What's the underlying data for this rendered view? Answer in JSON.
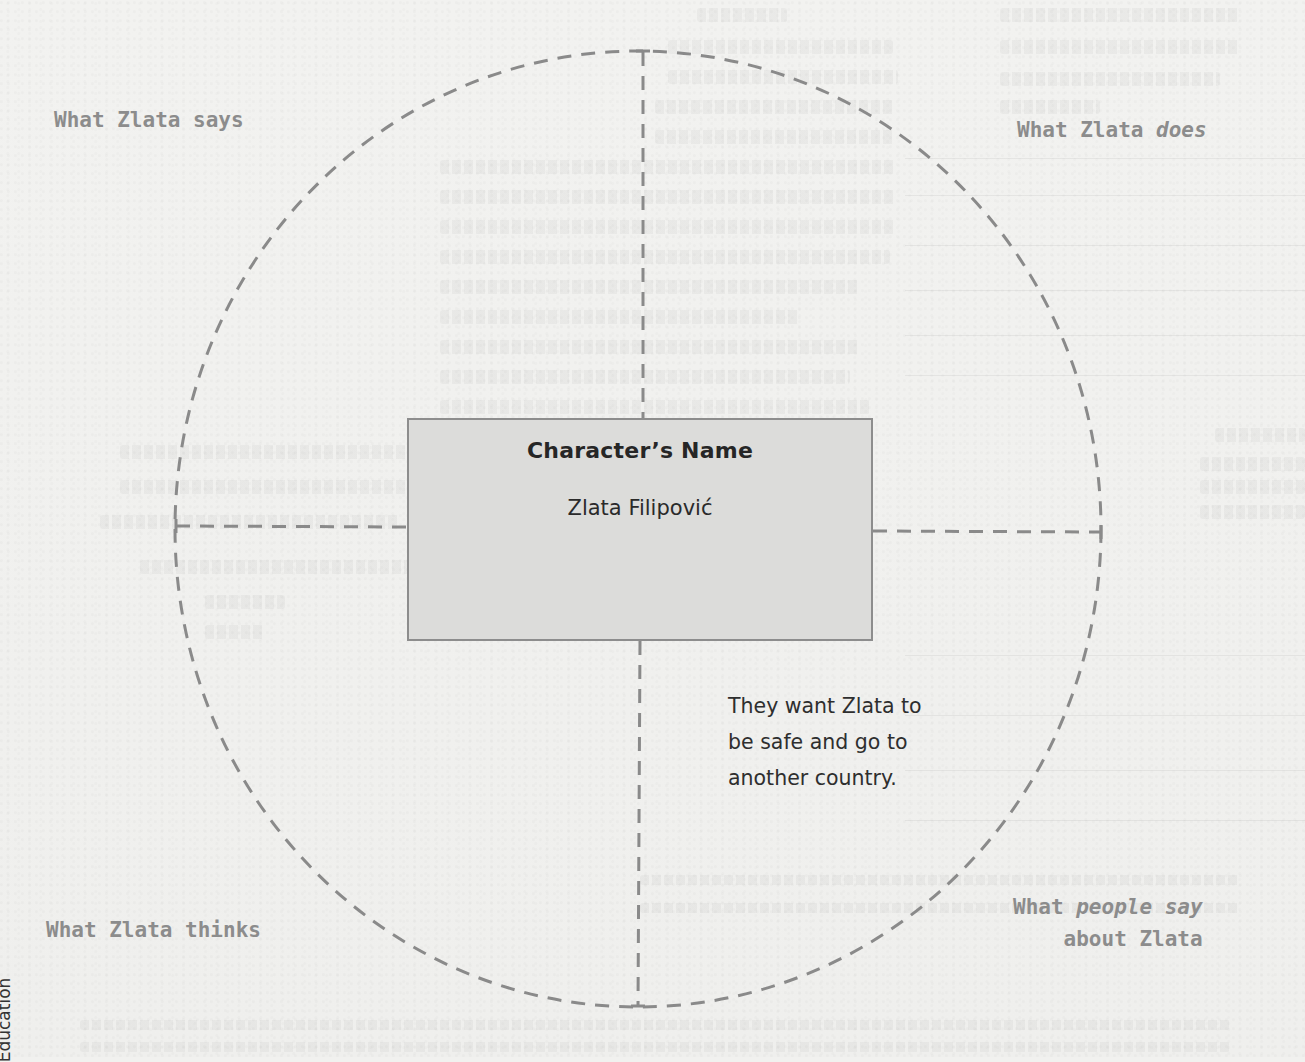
{
  "diagram": {
    "type": "character-web",
    "center": {
      "heading": "Character’s Name",
      "character_name": "Zlata Filipović"
    },
    "quadrants": [
      {
        "position": "top-left",
        "label": "What Zlata says",
        "answer": ""
      },
      {
        "position": "top-right",
        "label_prefix": "What Zlata ",
        "label_emphasis": "does",
        "answer": ""
      },
      {
        "position": "bottom-left",
        "label": "What Zlata thinks",
        "answer": ""
      },
      {
        "position": "bottom-right",
        "label_line1_prefix": "What ",
        "label_line1_emphasis": "people say",
        "label_line2": "about Zlata",
        "answer_lines": [
          "They want Zlata to",
          "be safe and go to",
          "another country."
        ]
      }
    ]
  },
  "margin": {
    "side_text": "Education"
  },
  "colors": {
    "paper": "#f1f1ef",
    "dash": "#8a8a8a",
    "label": "#8c8c8c",
    "box_fill": "#dcdcda",
    "box_border": "#8d8d8d",
    "ink": "#2e2e2e"
  }
}
